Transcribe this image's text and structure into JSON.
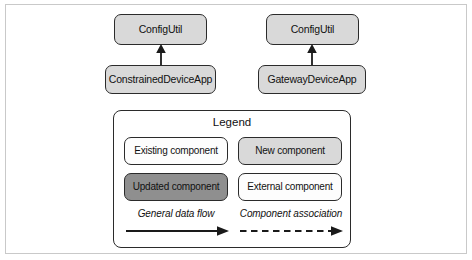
{
  "diagram": {
    "title": "",
    "colors": {
      "stroke": "#2b2b2b",
      "fill_light": "#d9d9d9",
      "fill_white": "#fdfdfd",
      "fill_dark": "#8f8f8f",
      "frame": "#c9c9c9",
      "background": "#ffffff",
      "text": "#111111",
      "text_inverse": "#ffffff"
    },
    "nodes": [
      {
        "id": "configutil_left",
        "label": "ConfigUtil",
        "style": "new"
      },
      {
        "id": "constraineddeviceapp",
        "label": "ConstrainedDeviceApp",
        "style": "new"
      },
      {
        "id": "configutil_right",
        "label": "ConfigUtil",
        "style": "new"
      },
      {
        "id": "gatewaydeviceapp",
        "label": "GatewayDeviceApp",
        "style": "new"
      }
    ],
    "edges": [
      {
        "from": "constraineddeviceapp",
        "to": "configutil_left",
        "style": "solid",
        "direction": "up"
      },
      {
        "from": "gatewaydeviceapp",
        "to": "configutil_right",
        "style": "solid",
        "direction": "up"
      }
    ]
  },
  "legend": {
    "title": "Legend",
    "swatches": [
      {
        "label": "Existing component",
        "style": "existing"
      },
      {
        "label": "New component",
        "style": "new"
      },
      {
        "label": "Updated component",
        "style": "updated"
      },
      {
        "label": "External component",
        "style": "external"
      }
    ],
    "arrows": [
      {
        "label": "General data flow",
        "style": "solid"
      },
      {
        "label": "Component association",
        "style": "dashed"
      }
    ]
  }
}
